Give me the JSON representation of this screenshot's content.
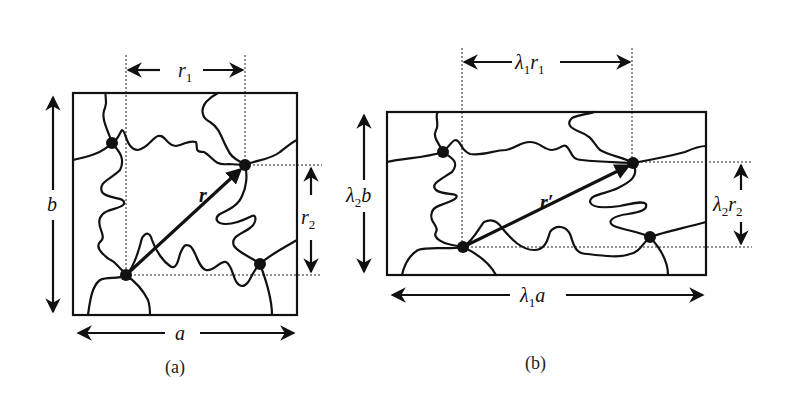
{
  "figure": {
    "panel_a": {
      "caption": "(a)",
      "width_label": "a",
      "height_label": "b",
      "vector_label": "r",
      "horiz_component": {
        "base": "r",
        "sub": "1"
      },
      "vert_component": {
        "base": "r",
        "sub": "2"
      }
    },
    "panel_b": {
      "caption": "(b)",
      "width_label": {
        "stretch": "λ",
        "stretch_sub": "1",
        "base": "a"
      },
      "height_label": {
        "stretch": "λ",
        "stretch_sub": "2",
        "base": "b"
      },
      "vector_label": "r′",
      "horiz_component": {
        "stretch": "λ",
        "stretch_sub": "1",
        "base": "r",
        "sub": "1"
      },
      "vert_component": {
        "stretch": "λ",
        "stretch_sub": "2",
        "base": "r",
        "sub": "2"
      }
    },
    "colors": {
      "ink": "#111111",
      "background": "#ffffff"
    }
  }
}
